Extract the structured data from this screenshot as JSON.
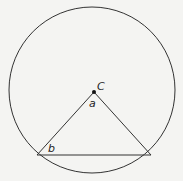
{
  "diagram": {
    "type": "geometry",
    "circle": {
      "cx": 92,
      "cy": 90,
      "r": 83,
      "stroke": "#333333"
    },
    "center_point": {
      "label": "C",
      "x": 94,
      "y": 92
    },
    "triangle": {
      "vertices": [
        {
          "x": 94,
          "y": 92
        },
        {
          "x": 37,
          "y": 155
        },
        {
          "x": 151,
          "y": 155
        }
      ]
    },
    "labels": {
      "center": "C",
      "apex_angle": "a",
      "base_angle": "b"
    }
  }
}
